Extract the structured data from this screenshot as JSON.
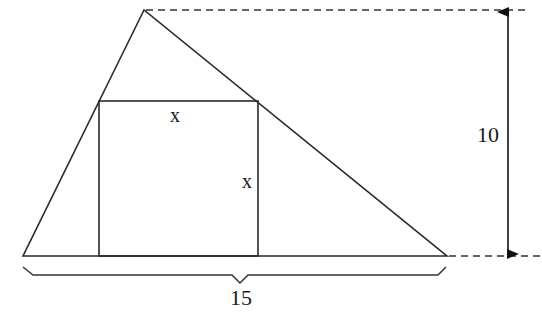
{
  "diagram": {
    "colors": {
      "stroke": "#2a2a2a",
      "text": "#1a1a1a",
      "background": "#ffffff"
    },
    "triangle": {
      "apex": [
        144,
        10
      ],
      "base_left": [
        23,
        256
      ],
      "base_right": [
        447,
        256
      ]
    },
    "square": {
      "x": 99,
      "y": 101,
      "width": 159,
      "height": 155
    },
    "labels": {
      "square_top": "x",
      "square_side": "x",
      "height": "10",
      "base": "15"
    }
  }
}
